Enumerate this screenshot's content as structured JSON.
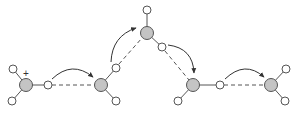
{
  "diagram": {
    "charge_label": "+",
    "colors": {
      "oxygen_fill": "#c4c4c4",
      "hydrogen_fill": "#ffffff",
      "outline": "#555555",
      "arrow": "#333333"
    },
    "molecules": [
      {
        "id": "hydronium",
        "role": "hydronium ion",
        "charged": true
      },
      {
        "id": "water-2",
        "role": "water"
      },
      {
        "id": "water-3",
        "role": "water"
      },
      {
        "id": "water-4",
        "role": "water"
      },
      {
        "id": "water-5",
        "role": "water"
      }
    ],
    "arrows": [
      {
        "from": "hydronium",
        "to": "water-2",
        "meaning": "proton transfer"
      },
      {
        "from": "water-2",
        "to": "water-3",
        "meaning": "proton transfer"
      },
      {
        "from": "water-3",
        "to": "water-4",
        "meaning": "proton transfer"
      },
      {
        "from": "water-4",
        "to": "water-5",
        "meaning": "proton transfer"
      }
    ]
  }
}
